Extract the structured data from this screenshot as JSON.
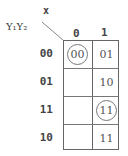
{
  "map": {
    "col_var": "x",
    "row_var": "Y₁Y₂",
    "col_headers": [
      "0",
      "1"
    ],
    "row_headers": [
      "00",
      "01",
      "11",
      "10"
    ],
    "cells": [
      [
        {
          "value": "00",
          "circled": true
        },
        {
          "value": "01",
          "circled": false
        }
      ],
      [
        {
          "value": "",
          "circled": false
        },
        {
          "value": "10",
          "circled": false
        }
      ],
      [
        {
          "value": "",
          "circled": false
        },
        {
          "value": "11",
          "circled": true
        }
      ],
      [
        {
          "value": "",
          "circled": false
        },
        {
          "value": "11",
          "circled": false
        }
      ]
    ]
  }
}
